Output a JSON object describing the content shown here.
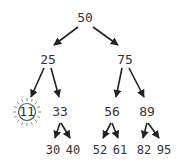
{
  "diagram": {
    "type": "binary-search-tree",
    "highlight_color": "#555555",
    "edge_color": "#222222",
    "text_color": "#333333",
    "nodes": [
      {
        "id": "n50",
        "label": "50",
        "x": 85,
        "y": 18
      },
      {
        "id": "n25",
        "label": "25",
        "x": 48,
        "y": 60
      },
      {
        "id": "n75",
        "label": "75",
        "x": 125,
        "y": 60
      },
      {
        "id": "n11",
        "label": "11",
        "x": 27,
        "y": 112,
        "highlighted": true
      },
      {
        "id": "n33",
        "label": "33",
        "x": 60,
        "y": 112
      },
      {
        "id": "n56",
        "label": "56",
        "x": 112,
        "y": 112
      },
      {
        "id": "n89",
        "label": "89",
        "x": 147,
        "y": 112
      },
      {
        "id": "n30",
        "label": "30",
        "x": 53,
        "y": 150
      },
      {
        "id": "n40",
        "label": "40",
        "x": 72,
        "y": 150
      },
      {
        "id": "n52",
        "label": "52",
        "x": 101,
        "y": 150
      },
      {
        "id": "n61",
        "label": "61",
        "x": 120,
        "y": 150
      },
      {
        "id": "n82",
        "label": "82",
        "x": 144,
        "y": 150
      },
      {
        "id": "n95",
        "label": "95",
        "x": 163,
        "y": 150
      }
    ],
    "edges": [
      [
        "50",
        "25"
      ],
      [
        "50",
        "75"
      ],
      [
        "25",
        "11"
      ],
      [
        "25",
        "33"
      ],
      [
        "75",
        "56"
      ],
      [
        "75",
        "89"
      ],
      [
        "33",
        "30"
      ],
      [
        "33",
        "40"
      ],
      [
        "56",
        "52"
      ],
      [
        "56",
        "61"
      ],
      [
        "89",
        "82"
      ],
      [
        "89",
        "95"
      ]
    ]
  }
}
